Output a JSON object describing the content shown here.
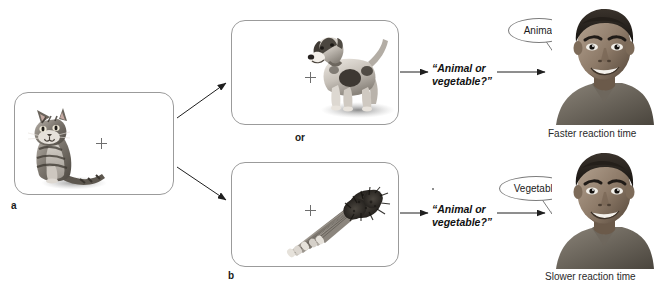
{
  "figure": {
    "kind": "semantic-categorization-experiment-diagram",
    "background_color": "#ffffff",
    "line_color": "#9b9b9b",
    "text_color": "#1a1a1a"
  },
  "panels": {
    "cue": {
      "letter": "a",
      "stimulus_name": "cat-photo",
      "stimulus_alt": "Sitting tabby cat, grayscale photograph",
      "fixation": "+"
    },
    "target_top": {
      "letter": "",
      "stimulus_name": "dog-photo",
      "stimulus_alt": "Standing terrier dog, grayscale photograph",
      "fixation": "+"
    },
    "target_bottom": {
      "letter": "b",
      "stimulus_name": "asparagus-photo",
      "stimulus_alt": "Bunch of asparagus, grayscale photograph",
      "fixation": "+"
    }
  },
  "connectors": {
    "or_label": "or"
  },
  "prompts": {
    "top_line1": "“Animal or",
    "top_line2": "vegetable?”",
    "bottom_line1": "“Animal or",
    "bottom_line2": "vegetable?”"
  },
  "responses": {
    "top": {
      "bubble_text": "Animal",
      "portrait_alt": "Smiling man, grayscale portrait photograph",
      "caption": "Faster reaction time"
    },
    "bottom": {
      "bubble_text": "Vegetable",
      "portrait_alt": "Smiling man, grayscale portrait photograph",
      "caption": "Slower reaction time"
    }
  }
}
